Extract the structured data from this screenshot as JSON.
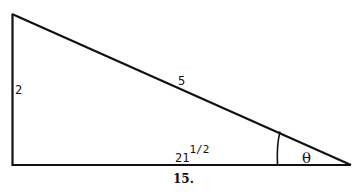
{
  "figure": {
    "caption": "15.",
    "colors": {
      "stroke": "#111111",
      "background": "#ffffff"
    },
    "triangle": {
      "vertices": {
        "top_left": [
          12,
          14
        ],
        "bottom_left": [
          13,
          165
        ],
        "right": [
          350,
          165
        ]
      },
      "right_angle_at": "bottom_left"
    },
    "labels": {
      "vertical_side": "2",
      "hypotenuse": "5",
      "horizontal_side_base": "21",
      "horizontal_side_exponent": "1/2",
      "angle": "θ"
    }
  }
}
